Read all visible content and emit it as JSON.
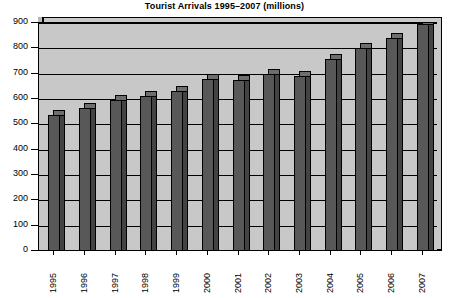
{
  "chart_data": {
    "type": "bar",
    "title": "Tourist Arrivals 1995–2007 (millions)",
    "xlabel": "",
    "ylabel": "",
    "categories": [
      "1995",
      "1996",
      "1997",
      "1998",
      "1999",
      "2000",
      "2001",
      "2002",
      "2003",
      "2004",
      "2005",
      "2006",
      "2007"
    ],
    "values": [
      535,
      565,
      595,
      610,
      630,
      678,
      675,
      700,
      690,
      757,
      800,
      840,
      895
    ],
    "ylim": [
      0,
      900
    ],
    "ytick_labels": [
      "0",
      "100",
      "200",
      "300",
      "400",
      "500",
      "600",
      "700",
      "800",
      "900"
    ],
    "ytick_values": [
      0,
      100,
      200,
      300,
      400,
      500,
      600,
      700,
      800,
      900
    ],
    "grid": true,
    "legend": false,
    "legend_position": "none",
    "style": "3d-bar",
    "colors": {
      "bar_face": "#585858",
      "bar_top": "#6e6e6e",
      "bar_side": "#434343",
      "plot_background": "#c8c8c8",
      "wall_shade": "#b9b9b9",
      "axis": "#000000",
      "text": "#000000",
      "page_background": "#ffffff"
    }
  }
}
